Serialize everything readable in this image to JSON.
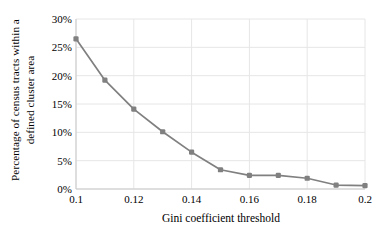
{
  "chart_data": {
    "type": "line",
    "title": "",
    "xlabel": "Gini coefficient threshold",
    "ylabel": "Percentage of census tracts within a defined cluster area",
    "ylabel_line1": "Percentage of census tracts within a",
    "ylabel_line2": "defined cluster area",
    "x": [
      0.1,
      0.11,
      0.12,
      0.13,
      0.14,
      0.15,
      0.16,
      0.17,
      0.18,
      0.19,
      0.2
    ],
    "values": [
      26.5,
      19.2,
      14.1,
      10.1,
      6.5,
      3.4,
      2.4,
      2.4,
      1.9,
      0.7,
      0.6
    ],
    "series": [
      {
        "name": "Percentage of census tracts within a defined cluster area",
        "values": [
          26.5,
          19.2,
          14.1,
          10.1,
          6.5,
          3.4,
          2.4,
          2.4,
          1.9,
          0.7,
          0.6
        ]
      }
    ],
    "xlim": [
      0.1,
      0.2
    ],
    "ylim": [
      0,
      30
    ],
    "xticks": [
      0.1,
      0.12,
      0.14,
      0.16,
      0.18,
      0.2
    ],
    "xtick_labels": [
      "0.1",
      "0.12",
      "0.14",
      "0.16",
      "0.18",
      "0.2"
    ],
    "yticks": [
      0,
      5,
      10,
      15,
      20,
      25,
      30
    ],
    "ytick_labels": [
      "0%",
      "5%",
      "10%",
      "15%",
      "20%",
      "25%",
      "30%"
    ],
    "grid": true,
    "grid_axes": "both",
    "legend": false,
    "legend_position": "none",
    "line_color": "#808080",
    "marker_color": "#808080",
    "marker": "square",
    "grid_color": "#e6e6e6",
    "background_color": "#ffffff",
    "text_color": "#000000"
  }
}
